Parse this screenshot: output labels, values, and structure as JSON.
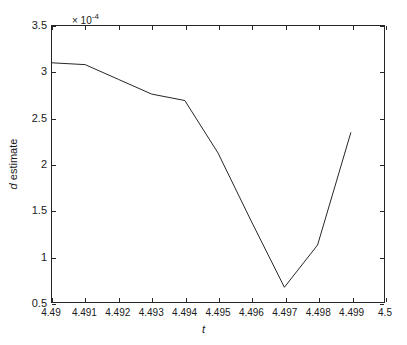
{
  "chart_data": {
    "type": "line",
    "title": "",
    "subtitle": "",
    "xlabel": "t",
    "ylabel": "d estimate",
    "y_multiplier_text": "× 10",
    "y_multiplier_exponent": "-4",
    "y_scale_factor": 0.0001,
    "xlim": [
      4.49,
      4.5
    ],
    "ylim": [
      0.5,
      3.5
    ],
    "grid": false,
    "legend": null,
    "x_ticks": [
      4.49,
      4.491,
      4.492,
      4.493,
      4.494,
      4.495,
      4.496,
      4.497,
      4.498,
      4.499,
      4.5
    ],
    "x_tick_labels": [
      "4.49",
      "4.491",
      "4.492",
      "4.493",
      "4.494",
      "4.495",
      "4.496",
      "4.497",
      "4.498",
      "4.499",
      "4.5"
    ],
    "y_ticks": [
      0.5,
      1,
      1.5,
      2,
      2.5,
      3,
      3.5
    ],
    "y_tick_labels": [
      "0.5",
      "1",
      "1.5",
      "2",
      "2.5",
      "3",
      "3.5"
    ],
    "line_color": "#262626",
    "line_width": 1,
    "x": [
      4.49,
      4.491,
      4.492,
      4.493,
      4.494,
      4.495,
      4.496,
      4.497,
      4.498,
      4.499
    ],
    "values": [
      3.1,
      3.08,
      2.92,
      2.76,
      2.69,
      2.12,
      1.38,
      0.66,
      1.12,
      2.34
    ],
    "series": [
      {
        "name": "d estimate",
        "values": [
          3.1,
          3.08,
          2.92,
          2.76,
          2.69,
          2.12,
          1.38,
          0.66,
          1.12,
          2.34
        ]
      }
    ],
    "annotations": []
  }
}
